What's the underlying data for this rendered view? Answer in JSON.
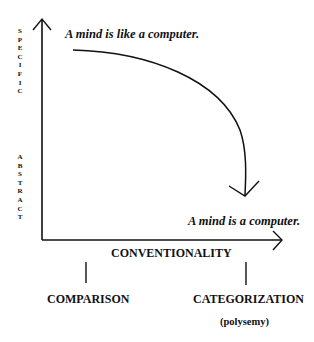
{
  "y_axis": {
    "top_label": "SPECIFIC",
    "bottom_label": "ABSTRACT"
  },
  "x_axis": {
    "title": "CONVENTIONALITY",
    "left_pole": "COMPARISON",
    "right_pole": "CATEGORIZATION",
    "right_pole_note": "(polysemy)"
  },
  "expressions": {
    "start": "A mind is like a computer.",
    "end": "A mind is a computer."
  },
  "colors": {
    "stroke": "#111111",
    "background": "#ffffff"
  }
}
